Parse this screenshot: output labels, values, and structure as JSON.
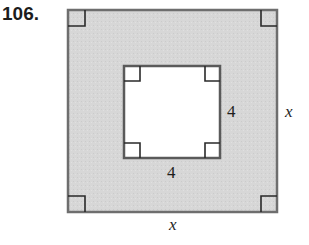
{
  "problem": {
    "number": "106."
  },
  "figure": {
    "outer_square": {
      "side_label_right": "x",
      "side_label_bottom": "x",
      "fill": "#d6d6d6",
      "stroke": "#6a6a6a"
    },
    "inner_square": {
      "side_label_right": "4",
      "side_label_bottom": "4",
      "fill": "#ffffff",
      "stroke": "#5a5a5a"
    },
    "right_angle_markers": 8
  }
}
